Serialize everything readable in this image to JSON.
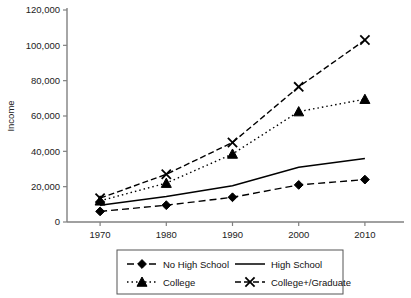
{
  "chart_data": {
    "type": "line",
    "title": "",
    "xlabel": "",
    "ylabel": "Income",
    "x": [
      1970,
      1980,
      1990,
      2000,
      2010
    ],
    "xtick_labels": [
      "1970",
      "1980",
      "1990",
      "2000",
      "2010"
    ],
    "ytick_labels": [
      "0",
      "20,000",
      "40,000",
      "60,000",
      "80,000",
      "100,000",
      "120,000"
    ],
    "ytick_values": [
      0,
      20000,
      40000,
      60000,
      80000,
      100000,
      120000
    ],
    "xlim": [
      1965,
      2015
    ],
    "ylim": [
      0,
      120000
    ],
    "grid": false,
    "legend_position": "below",
    "series": [
      {
        "name": "No High School",
        "values": [
          6000,
          9500,
          14000,
          21000,
          24000
        ],
        "marker": "diamond",
        "line_style": "dashed"
      },
      {
        "name": "High School",
        "values": [
          9500,
          14500,
          20500,
          31000,
          36000
        ],
        "marker": "none",
        "line_style": "solid"
      },
      {
        "name": "College",
        "values": [
          12000,
          22000,
          38500,
          62500,
          69500
        ],
        "marker": "triangle",
        "line_style": "dotted"
      },
      {
        "name": "College+/Graduate",
        "values": [
          13500,
          27000,
          45000,
          76500,
          103000
        ],
        "marker": "x",
        "line_style": "dashdot"
      }
    ]
  },
  "legend": {
    "entries": [
      {
        "label": "No High School"
      },
      {
        "label": "High School"
      },
      {
        "label": "College"
      },
      {
        "label": "College+/Graduate"
      }
    ]
  },
  "colors": {
    "ink": "#000000",
    "axis": "#808080",
    "text": "#222222",
    "background": "#ffffff"
  }
}
